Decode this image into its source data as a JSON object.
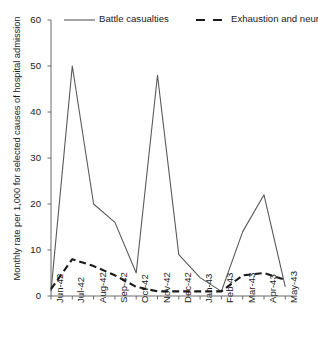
{
  "chart_data": {
    "type": "line",
    "title": "",
    "xlabel": "",
    "ylabel": "Monthly rate per 1,000 for selected causes of hospital admission",
    "categories": [
      "Jun-42",
      "Jul-42",
      "Aug-42",
      "Sep-42",
      "Oct-42",
      "Nov-42",
      "Dec-42",
      "Jan-43",
      "Feb-43",
      "Mar-43",
      "Apr-43",
      "May-43"
    ],
    "ylim": [
      0,
      60
    ],
    "yticks": [
      0,
      10,
      20,
      30,
      40,
      50,
      60
    ],
    "ytick_labels": [
      "0",
      "10",
      "20",
      "30",
      "40",
      "50",
      "60"
    ],
    "grid": false,
    "legend_position": "top",
    "series": [
      {
        "name": "Battle casualties",
        "style": "solid",
        "color": "#5a5a5a",
        "values": [
          1,
          50,
          20,
          16,
          5,
          48,
          9,
          4,
          1,
          14,
          22,
          2
        ]
      },
      {
        "name": "Exhaustion and neurosis",
        "style": "dashed",
        "color": "#1a1a1a",
        "values": [
          1.5,
          8,
          6.5,
          4.5,
          2,
          1,
          1,
          1,
          1,
          4.5,
          5,
          3.5
        ]
      }
    ]
  },
  "axes": {
    "axis_color": "#6b6b6b"
  }
}
